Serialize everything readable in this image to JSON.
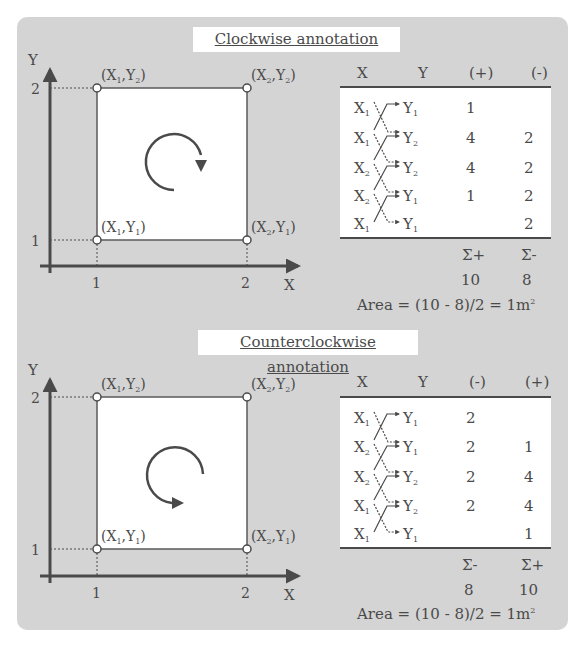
{
  "colors": {
    "panel": "#d4d4d4",
    "line": "#4a4a4a",
    "white": "#ffffff"
  },
  "sections": [
    {
      "title": "Clockwise annotation",
      "rotation": "clockwise",
      "axis": {
        "x_label": "X",
        "y_label": "Y",
        "x_ticks": [
          "1",
          "2"
        ],
        "y_ticks": [
          "1",
          "2"
        ]
      },
      "points": {
        "tl": "(X1,Y2)",
        "tr": "(X2,Y2)",
        "bl": "(X1,Y1)",
        "br": "(X2,Y1)"
      },
      "table": {
        "headers": [
          "X",
          "Y",
          "(+)",
          "(-)"
        ],
        "rows": [
          {
            "x": "X1",
            "y": "Y1",
            "a": "1",
            "b": ""
          },
          {
            "x": "X1",
            "y": "Y2",
            "a": "4",
            "b": "2"
          },
          {
            "x": "X2",
            "y": "Y2",
            "a": "4",
            "b": "2"
          },
          {
            "x": "X2",
            "y": "Y1",
            "a": "1",
            "b": "2"
          },
          {
            "x": "X1",
            "y": "Y1",
            "a": "",
            "b": "2"
          }
        ],
        "sum_labels": [
          "Σ+",
          "Σ-"
        ],
        "sums": [
          "10",
          "8"
        ],
        "area": "Area = (10 - 8)/2 = 1m²"
      }
    },
    {
      "title": "Counterclockwise annotation",
      "rotation": "counterclockwise",
      "axis": {
        "x_label": "X",
        "y_label": "Y",
        "x_ticks": [
          "1",
          "2"
        ],
        "y_ticks": [
          "1",
          "2"
        ]
      },
      "points": {
        "tl": "(X1,Y2)",
        "tr": "(X2,Y2)",
        "bl": "(X1,Y1)",
        "br": "(X2,Y1)"
      },
      "table": {
        "headers": [
          "X",
          "Y",
          "(-)",
          "(+)"
        ],
        "rows": [
          {
            "x": "X1",
            "y": "Y1",
            "a": "2",
            "b": ""
          },
          {
            "x": "X2",
            "y": "Y1",
            "a": "2",
            "b": "1"
          },
          {
            "x": "X2",
            "y": "Y2",
            "a": "2",
            "b": "4"
          },
          {
            "x": "X1",
            "y": "Y2",
            "a": "2",
            "b": "4"
          },
          {
            "x": "X1",
            "y": "Y1",
            "a": "",
            "b": "1"
          }
        ],
        "sum_labels": [
          "Σ-",
          "Σ+"
        ],
        "sums": [
          "8",
          "10"
        ],
        "area": "Area = (10 - 8)/2 = 1m²"
      }
    }
  ]
}
